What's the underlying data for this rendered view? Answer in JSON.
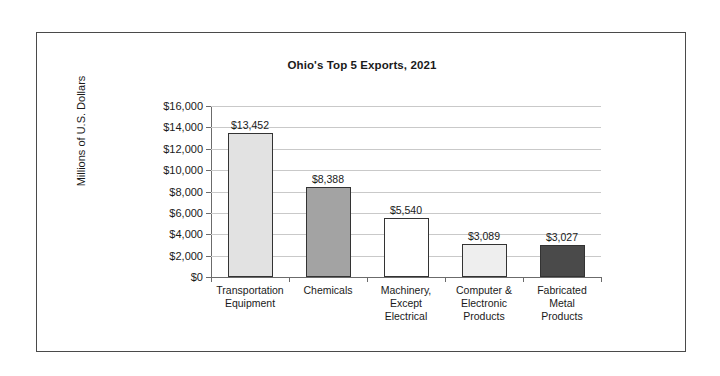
{
  "figure": {
    "title": "Ohio's Top 5 Exports, 2021",
    "y_axis_title": "Millions of U.S. Dollars"
  },
  "chart_data": {
    "type": "bar",
    "title": "Ohio's Top 5 Exports, 2021",
    "xlabel": "",
    "ylabel": "Millions of U.S. Dollars",
    "ylim": [
      0,
      16000
    ],
    "ytick_step": 2000,
    "grid": true,
    "legend": "none",
    "categories": [
      "Transportation Equipment",
      "Chemicals",
      "Machinery, Except Electrical",
      "Computer & Electronic Products",
      "Fabricated Metal Products"
    ],
    "category_lines": [
      [
        "Transportation",
        "Equipment"
      ],
      [
        "Chemicals"
      ],
      [
        "Machinery,",
        "Except",
        "Electrical"
      ],
      [
        "Computer &",
        "Electronic",
        "Products"
      ],
      [
        "Fabricated",
        "Metal",
        "Products"
      ]
    ],
    "values": [
      13452,
      8388,
      5540,
      3089,
      3027
    ],
    "data_labels": [
      "$13,452",
      "$8,388",
      "$5,540",
      "$3,089",
      "$3,027"
    ],
    "bar_colors": [
      "#e2e2e2",
      "#a3a3a3",
      "#ffffff",
      "#eeeeee",
      "#4a4a4a"
    ],
    "bar_border_color": "#333333",
    "ytick_labels": [
      "$16,000",
      "$14,000",
      "$12,000",
      "$10,000",
      "$8,000",
      "$6,000",
      "$4,000",
      "$2,000",
      "$0"
    ],
    "ytick_values": [
      16000,
      14000,
      12000,
      10000,
      8000,
      6000,
      4000,
      2000,
      0
    ]
  }
}
